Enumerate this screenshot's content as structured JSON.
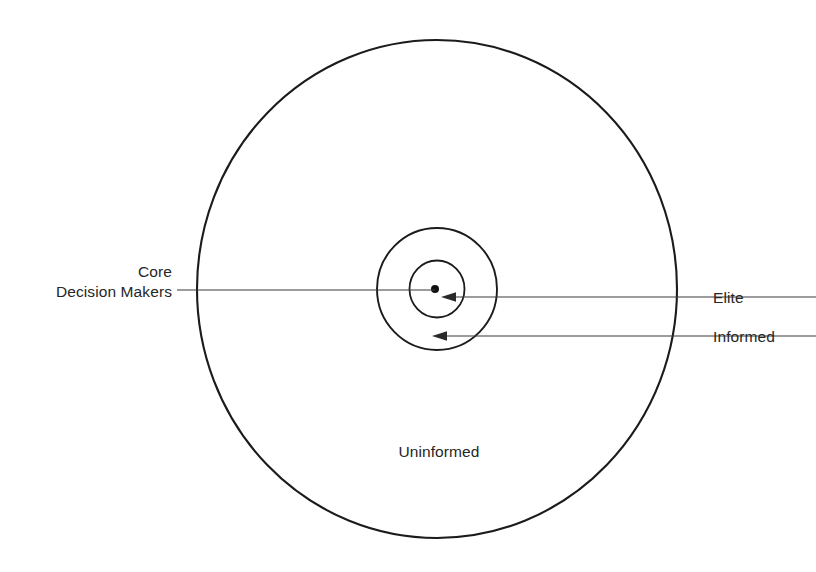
{
  "diagram": {
    "background_color": "#ffffff",
    "stroke_color": "#1b1b1b",
    "text_color": "#262626",
    "labels": {
      "core_line1": "Core",
      "core_line2": "Decision Makers",
      "elite": "Elite",
      "informed": "Informed",
      "uninformed": "Uninformed"
    },
    "rings": [
      {
        "name": "uninformed",
        "label": "Uninformed",
        "cx": 437,
        "cy": 289,
        "rx": 240,
        "ry": 249,
        "level": 4
      },
      {
        "name": "informed",
        "label": "Informed",
        "cx": 437,
        "cy": 289,
        "rx": 60,
        "ry": 61,
        "level": 3
      },
      {
        "name": "elite",
        "label": "Elite",
        "cx": 437,
        "cy": 289,
        "rx": 27.5,
        "ry": 28.5,
        "level": 2
      },
      {
        "name": "core-decision-makers",
        "label": "Core Decision Makers",
        "cx": 435,
        "cy": 289,
        "rx": 4,
        "ry": 4,
        "level": 1
      }
    ],
    "leaders": [
      {
        "name": "core-decision-makers-leader",
        "from_x": 177,
        "from_y": 290,
        "to_x": 435,
        "to_y": 290,
        "arrow": false
      },
      {
        "name": "elite-leader",
        "from_x": 816,
        "from_y": 297,
        "to_x": 441,
        "to_y": 297,
        "arrow": true
      },
      {
        "name": "informed-leader",
        "from_x": 816,
        "from_y": 336,
        "to_x": 432,
        "to_y": 336,
        "arrow": true
      }
    ]
  }
}
